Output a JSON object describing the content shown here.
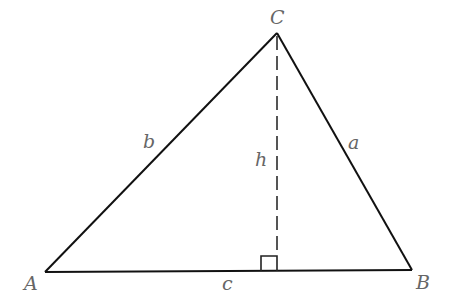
{
  "diagram": {
    "type": "triangle-with-altitude",
    "vertices": [
      {
        "name": "A",
        "x": 45,
        "y": 272,
        "label_x": 24,
        "label_y": 290
      },
      {
        "name": "B",
        "x": 412,
        "y": 270,
        "label_x": 416,
        "label_y": 289
      },
      {
        "name": "C",
        "x": 277,
        "y": 33,
        "label_x": 270,
        "label_y": 24
      }
    ],
    "sides": [
      {
        "name": "a",
        "label": "a",
        "label_x": 348,
        "label_y": 149
      },
      {
        "name": "b",
        "label": "b",
        "label_x": 143,
        "label_y": 148
      },
      {
        "name": "c",
        "label": "c",
        "label_x": 222,
        "label_y": 290
      }
    ],
    "altitude": {
      "label": "h",
      "label_x": 255,
      "label_y": 166,
      "foot_x": 277,
      "foot_y": 271
    },
    "right_angle_marker": {
      "size": 16
    },
    "colors": {
      "line": "#111111",
      "label": "#666666",
      "dashed": "#555555"
    }
  }
}
